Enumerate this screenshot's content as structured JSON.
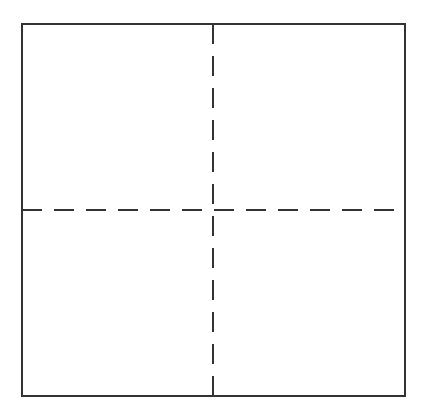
{
  "diagram": {
    "type": "quadrant-grid",
    "canvas": {
      "width": 439,
      "height": 418,
      "background": "#ffffff"
    },
    "square": {
      "x": 22,
      "y": 24,
      "width": 383,
      "height": 372,
      "stroke": "#333333",
      "stroke_width": 2
    },
    "dividers": {
      "vertical": {
        "x": 213,
        "y1": 24,
        "y2": 396,
        "dash": [
          20,
          12
        ],
        "stroke": "#333333",
        "stroke_width": 2
      },
      "horizontal": {
        "y": 210,
        "x1": 22,
        "x2": 405,
        "dash": [
          20,
          12
        ],
        "stroke": "#333333",
        "stroke_width": 2
      }
    },
    "quadrants": [
      {
        "id": "top-left",
        "label": ""
      },
      {
        "id": "top-right",
        "label": ""
      },
      {
        "id": "bottom-left",
        "label": ""
      },
      {
        "id": "bottom-right",
        "label": ""
      }
    ]
  }
}
